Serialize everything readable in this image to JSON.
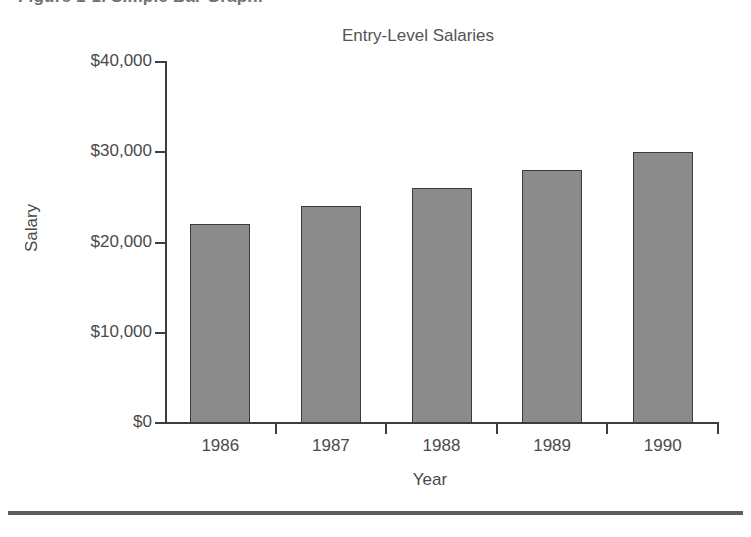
{
  "figure": {
    "caption": "Figure 1-1. Simple Bar Graph."
  },
  "axis_titles": {
    "y": "Salary",
    "x": "Year"
  },
  "chart_data": {
    "type": "bar",
    "title": "Entry-Level Salaries",
    "xlabel": "Year",
    "ylabel": "Salary",
    "categories": [
      "1986",
      "1987",
      "1988",
      "1989",
      "1990"
    ],
    "values": [
      22000,
      24000,
      26000,
      28000,
      30000
    ],
    "ylim": [
      0,
      40000
    ],
    "yticks": [
      0,
      10000,
      20000,
      30000,
      40000
    ],
    "ytick_labels": [
      "$0",
      "$10,000",
      "$20,000",
      "$30,000",
      "$40,000"
    ],
    "grid": false,
    "legend": null,
    "bar_color": "#8b8b8b",
    "bar_edge_color": "#3b3b3b",
    "axis_color": "#3d3d3d"
  }
}
